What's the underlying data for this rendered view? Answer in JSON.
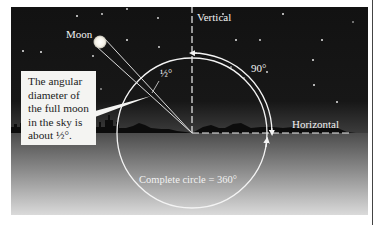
{
  "figure": {
    "colors": {
      "sky": "#131313",
      "horizon_glow": "#3a3a3a",
      "ground_top": "#4e4e4e",
      "ground_bottom": "#dcdcdc",
      "lines": "#f4f4f4",
      "moon": "#f8f6ee",
      "callout_bg": "#f4f4f2"
    },
    "labels": {
      "moon": "Moon",
      "vertical": "Vertical",
      "horizontal": "Horizontal",
      "right_angle": "90°",
      "half_degree": "½°",
      "complete_circle": "Complete circle = 360°"
    },
    "callout": {
      "lines": [
        "The angular",
        "diameter of",
        "the full moon",
        "in the sky is",
        "about ½°."
      ]
    },
    "geometry": {
      "vertex": [
        181,
        126
      ],
      "circle_radius": 75,
      "arc_90_radius": 80,
      "moon_center": [
        89,
        35
      ],
      "moon_radius": 6
    }
  }
}
